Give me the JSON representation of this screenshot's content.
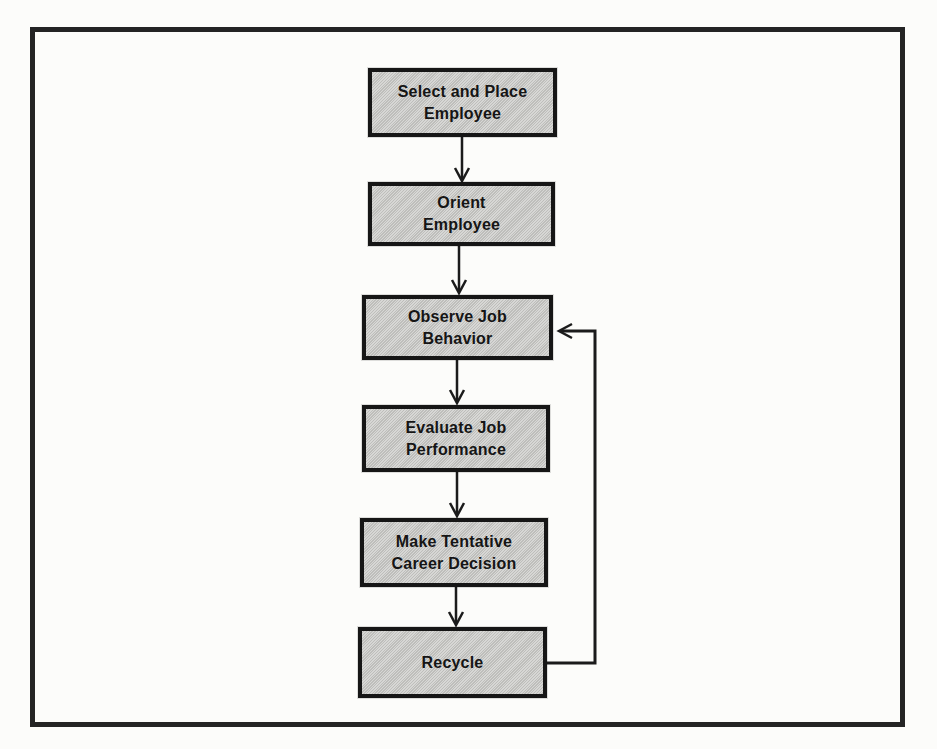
{
  "figure": {
    "type": "flowchart",
    "background_color": "#fcfcfa",
    "frame_border_color": "#242424",
    "node_fill_color": "#c8c8c5",
    "node_border_color": "#161616",
    "arrow_color": "#1b1b1b",
    "text_color": "#151515"
  },
  "flowchart": {
    "nodes": [
      {
        "id": "select-and-place-employee",
        "label": "Select and Place\nEmployee"
      },
      {
        "id": "orient-employee",
        "label": "Orient\nEmployee"
      },
      {
        "id": "observe-job-behavior",
        "label": "Observe Job\nBehavior"
      },
      {
        "id": "evaluate-job-performance",
        "label": "Evaluate Job\nPerformance"
      },
      {
        "id": "make-tentative-career-decision",
        "label": "Make Tentative\nCareer Decision"
      },
      {
        "id": "recycle",
        "label": "Recycle"
      }
    ],
    "edges": [
      {
        "from": "select-and-place-employee",
        "to": "orient-employee",
        "type": "forward"
      },
      {
        "from": "orient-employee",
        "to": "observe-job-behavior",
        "type": "forward"
      },
      {
        "from": "observe-job-behavior",
        "to": "evaluate-job-performance",
        "type": "forward"
      },
      {
        "from": "evaluate-job-performance",
        "to": "make-tentative-career-decision",
        "type": "forward"
      },
      {
        "from": "make-tentative-career-decision",
        "to": "recycle",
        "type": "forward"
      },
      {
        "from": "recycle",
        "to": "observe-job-behavior",
        "type": "feedback-loop"
      }
    ]
  }
}
